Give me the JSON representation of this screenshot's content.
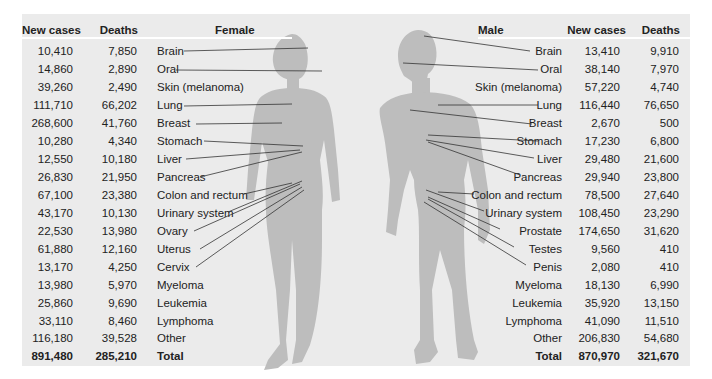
{
  "colors": {
    "panel_bg": "#ebebeb",
    "silhouette": "#bdbdbd",
    "leader_line": "#333333",
    "text": "#222222"
  },
  "female": {
    "header": {
      "new_cases": "New cases",
      "deaths": "Deaths",
      "title": "Female"
    },
    "rows": [
      {
        "site": "Brain",
        "new_cases": "10,410",
        "deaths": "7,850"
      },
      {
        "site": "Oral",
        "new_cases": "14,860",
        "deaths": "2,890"
      },
      {
        "site": "Skin (melanoma)",
        "new_cases": "39,260",
        "deaths": "2,490"
      },
      {
        "site": "Lung",
        "new_cases": "111,710",
        "deaths": "66,202"
      },
      {
        "site": "Breast",
        "new_cases": "268,600",
        "deaths": "41,760"
      },
      {
        "site": "Stomach",
        "new_cases": "10,280",
        "deaths": "4,340"
      },
      {
        "site": "Liver",
        "new_cases": "12,550",
        "deaths": "10,180"
      },
      {
        "site": "Pancreas",
        "new_cases": "26,830",
        "deaths": "21,950"
      },
      {
        "site": "Colon and rectum",
        "new_cases": "67,100",
        "deaths": "23,380"
      },
      {
        "site": "Urinary system",
        "new_cases": "43,170",
        "deaths": "10,130"
      },
      {
        "site": "Ovary",
        "new_cases": "22,530",
        "deaths": "13,980"
      },
      {
        "site": "Uterus",
        "new_cases": "61,880",
        "deaths": "12,160"
      },
      {
        "site": "Cervix",
        "new_cases": "13,170",
        "deaths": "4,250"
      },
      {
        "site": "Myeloma",
        "new_cases": "13,980",
        "deaths": "5,970"
      },
      {
        "site": "Leukemia",
        "new_cases": "25,860",
        "deaths": "9,690"
      },
      {
        "site": "Lymphoma",
        "new_cases": "33,110",
        "deaths": "8,460"
      },
      {
        "site": "Other",
        "new_cases": "116,180",
        "deaths": "39,528"
      }
    ],
    "total": {
      "site": "Total",
      "new_cases": "891,480",
      "deaths": "285,210"
    }
  },
  "male": {
    "header": {
      "new_cases": "New cases",
      "deaths": "Deaths",
      "title": "Male"
    },
    "rows": [
      {
        "site": "Brain",
        "new_cases": "13,410",
        "deaths": "9,910"
      },
      {
        "site": "Oral",
        "new_cases": "38,140",
        "deaths": "7,970"
      },
      {
        "site": "Skin (melanoma)",
        "new_cases": "57,220",
        "deaths": "4,740"
      },
      {
        "site": "Lung",
        "new_cases": "116,440",
        "deaths": "76,650"
      },
      {
        "site": "Breast",
        "new_cases": "2,670",
        "deaths": "500"
      },
      {
        "site": "Stomach",
        "new_cases": "17,230",
        "deaths": "6,800"
      },
      {
        "site": "Liver",
        "new_cases": "29,480",
        "deaths": "21,600"
      },
      {
        "site": "Pancreas",
        "new_cases": "29,940",
        "deaths": "23,800"
      },
      {
        "site": "Colon and rectum",
        "new_cases": "78,500",
        "deaths": "27,640"
      },
      {
        "site": "Urinary system",
        "new_cases": "108,450",
        "deaths": "23,290"
      },
      {
        "site": "Prostate",
        "new_cases": "174,650",
        "deaths": "31,620"
      },
      {
        "site": "Testes",
        "new_cases": "9,560",
        "deaths": "410"
      },
      {
        "site": "Penis",
        "new_cases": "2,080",
        "deaths": "410"
      },
      {
        "site": "Myeloma",
        "new_cases": "18,130",
        "deaths": "6,990"
      },
      {
        "site": "Leukemia",
        "new_cases": "35,920",
        "deaths": "13,150"
      },
      {
        "site": "Lymphoma",
        "new_cases": "41,090",
        "deaths": "11,510"
      },
      {
        "site": "Other",
        "new_cases": "206,830",
        "deaths": "54,680"
      }
    ],
    "total": {
      "site": "Total",
      "new_cases": "870,970",
      "deaths": "321,670"
    }
  }
}
